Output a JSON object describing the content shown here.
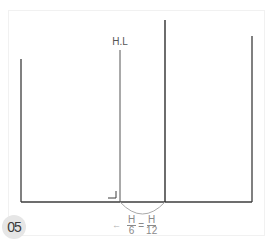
{
  "diagram": {
    "step_number": "05",
    "horizon_label": "H.L",
    "formula": {
      "arrow": "←",
      "left_fraction": {
        "numerator": "H",
        "denominator": "6"
      },
      "equals": "=",
      "right_fraction": {
        "numerator": "H",
        "denominator": "12"
      }
    },
    "colors": {
      "line": "#3c3c3c",
      "thin_line": "#555555",
      "arc": "#aaaaaa",
      "text": "#555555",
      "badge_bg": "#e6e6e6",
      "frame": "#f1f1f1"
    },
    "lines": [
      {
        "name": "left-vertical",
        "x": 21,
        "top": 59,
        "bottom": 202
      },
      {
        "name": "horizon-vertical",
        "x": 120,
        "top": 50,
        "bottom": 202
      },
      {
        "name": "tall-middle-vertical",
        "x": 165,
        "top": 20,
        "bottom": 202
      },
      {
        "name": "right-vertical",
        "x": 252,
        "top": 36,
        "bottom": 202
      },
      {
        "name": "baseline",
        "y": 202,
        "left": 21,
        "right": 252
      }
    ]
  }
}
